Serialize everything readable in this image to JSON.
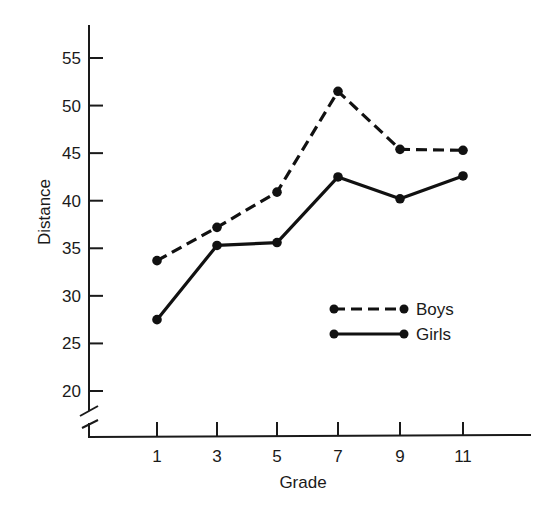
{
  "chart_data": {
    "type": "line",
    "title": "",
    "xlabel": "Grade",
    "ylabel": "Distance",
    "x": [
      1,
      3,
      5,
      7,
      9,
      11
    ],
    "x_tick_labels": [
      "1",
      "3",
      "5",
      "7",
      "9",
      "11"
    ],
    "y_ticks": [
      20,
      25,
      30,
      35,
      40,
      45,
      50,
      55
    ],
    "y_tick_labels": [
      "20",
      "25",
      "30",
      "35",
      "40",
      "45",
      "50",
      "55"
    ],
    "ylim": [
      17,
      57
    ],
    "y_axis_break": true,
    "grid": false,
    "legend_position": "inside-lower-right",
    "series": [
      {
        "name": "Boys",
        "style": "dashed",
        "marker": "circle",
        "values": [
          33.7,
          37.2,
          40.9,
          51.5,
          45.4,
          45.3
        ]
      },
      {
        "name": "Girls",
        "style": "solid",
        "marker": "circle",
        "values": [
          27.5,
          35.3,
          35.6,
          42.5,
          40.2,
          42.6
        ]
      }
    ],
    "colors": {
      "ink": "#111111",
      "background": "#ffffff"
    }
  },
  "legend": {
    "items": [
      {
        "label": "Boys",
        "style": "dashed"
      },
      {
        "label": "Girls",
        "style": "solid"
      }
    ]
  },
  "axes": {
    "x_title": "Grade",
    "y_title": "Distance"
  }
}
